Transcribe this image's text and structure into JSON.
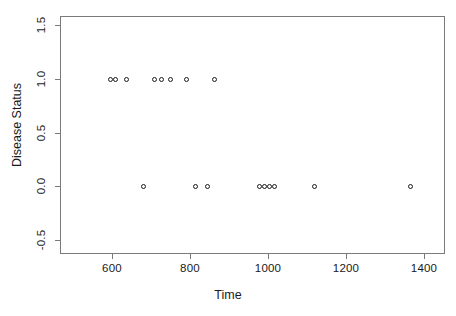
{
  "chart_data": {
    "type": "scatter",
    "title": "",
    "xlabel": "Time",
    "ylabel": "Disease Status",
    "xlim": [
      470,
      1455
    ],
    "ylim": [
      -0.62,
      1.6
    ],
    "grid": false,
    "legend": null,
    "x_ticks": [
      600,
      800,
      1000,
      1200,
      1400
    ],
    "x_tick_labels": [
      "600",
      "800",
      "1000",
      "1200",
      "1400"
    ],
    "y_ticks": [
      -0.5,
      0.0,
      0.5,
      1.0,
      1.5
    ],
    "y_tick_labels": [
      "-0.5",
      "0.0",
      "0.5",
      "1.0",
      "1.5"
    ],
    "marker": "open-circle",
    "marker_color": "#1a1a1a",
    "points": [
      {
        "x": 597,
        "y": 1.0
      },
      {
        "x": 610,
        "y": 1.0
      },
      {
        "x": 637,
        "y": 1.0
      },
      {
        "x": 710,
        "y": 1.0
      },
      {
        "x": 726,
        "y": 1.0
      },
      {
        "x": 751,
        "y": 1.0
      },
      {
        "x": 790,
        "y": 1.0
      },
      {
        "x": 864,
        "y": 1.0
      },
      {
        "x": 682,
        "y": 0.0
      },
      {
        "x": 813,
        "y": 0.0
      },
      {
        "x": 844,
        "y": 0.0
      },
      {
        "x": 977,
        "y": 0.0
      },
      {
        "x": 990,
        "y": 0.0
      },
      {
        "x": 1003,
        "y": 0.0
      },
      {
        "x": 1016,
        "y": 0.0
      },
      {
        "x": 1118,
        "y": 0.0
      },
      {
        "x": 1366,
        "y": 0.0
      }
    ],
    "series": [
      {
        "name": "Disease Status vs Time",
        "x": [
          597,
          610,
          637,
          710,
          726,
          751,
          790,
          864,
          682,
          813,
          844,
          977,
          990,
          1003,
          1016,
          1118,
          1366
        ],
        "values": [
          1,
          1,
          1,
          1,
          1,
          1,
          1,
          1,
          0,
          0,
          0,
          0,
          0,
          0,
          0,
          0,
          0
        ]
      }
    ]
  },
  "axes": {
    "x_title": "Time",
    "y_title": "Disease Status"
  },
  "colors": {
    "frame": "#7a7a7a",
    "marker": "#1a1a1a",
    "text": "#1a1a1a",
    "background": "#ffffff"
  }
}
